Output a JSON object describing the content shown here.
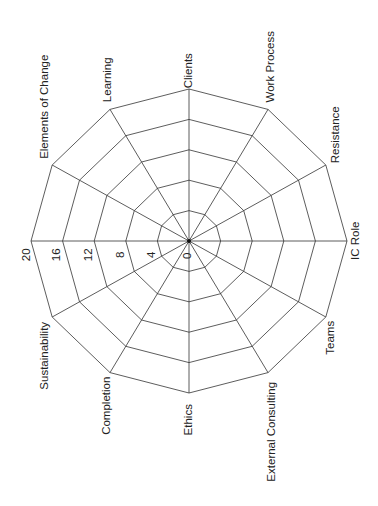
{
  "chart_data": {
    "type": "radar",
    "title": "",
    "orientation": "rotated -90deg (labels read bottom-to-top)",
    "categories": [
      "Clients",
      "Work Process",
      "Resistance",
      "IC Role",
      "Teams",
      "External Consulting",
      "Ethics",
      "Completion",
      "Sustainability",
      "Elements of Change",
      "Learning"
    ],
    "axes_all": [
      "Clients",
      "Work Process",
      "Resistance",
      "IC Role",
      "Teams",
      "External Consulting",
      "Ethics",
      "Completion",
      "Sustainability",
      "20-axis",
      "Elements of Change",
      "Learning"
    ],
    "radial_ticks": [
      "0",
      "4",
      "8",
      "12",
      "16",
      "20"
    ],
    "rlim": [
      0,
      20
    ],
    "grid": true,
    "series": [],
    "legend": null
  },
  "labels": {
    "clients": "Clients",
    "work_process": "Work Process",
    "resistance": "Resistance",
    "ic_role": "IC Role",
    "teams": "Teams",
    "external_consulting": "External Consulting",
    "ethics": "Ethics",
    "completion": "Completion",
    "sustainability": "Sustainability",
    "elements_of_change": "Elements of Change",
    "learning": "Learning"
  },
  "ticks": {
    "t0": "0",
    "t4": "4",
    "t8": "8",
    "t12": "12",
    "t16": "16",
    "t20": "20"
  },
  "colors": {
    "grid": "#333333",
    "text": "#222222",
    "background": "#ffffff"
  }
}
